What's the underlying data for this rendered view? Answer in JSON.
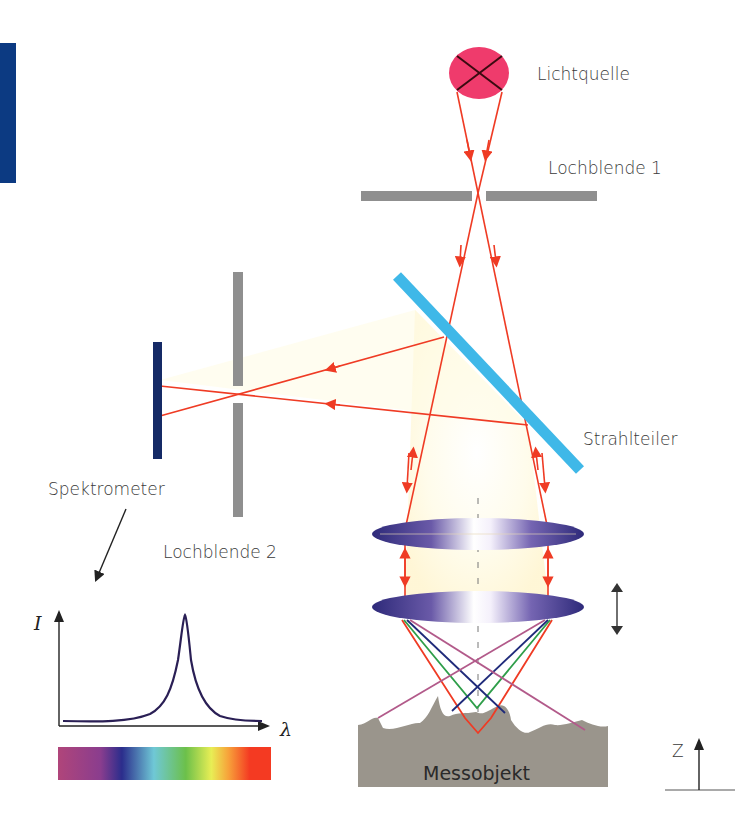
{
  "labels": {
    "light_source": "Lichtquelle",
    "pinhole_1": "Lochblende 1",
    "beam_splitter": "Strahlteiler",
    "spectrometer": "Spektrometer",
    "pinhole_2": "Lochblende 2",
    "object": "Messobjekt",
    "z_axis": "Z"
  },
  "spectrum_plot": {
    "y_axis_label": "I",
    "x_axis_label": "λ",
    "curve": "single sharp peak (Lorentzian-like)",
    "spectrum_colors": [
      "#b0457a",
      "#7a3a8e",
      "#2b2d8c",
      "#6fc8d6",
      "#6cc04a",
      "#e8ee55",
      "#f7a23a",
      "#f43a22"
    ]
  },
  "colors": {
    "ray": "#ef3b24",
    "ray_blue": "#1f2a7a",
    "ray_green": "#2f9e4a",
    "ray_magenta": "#b25a8a",
    "pinhole": "#8f8f8f",
    "beam_splitter": "#3fb8e8",
    "detector": "#152a66",
    "light_source": "#ef3b6c",
    "lens": "#4a3a8e",
    "object": "#9a958c",
    "side_bar": "#0c3a82"
  }
}
